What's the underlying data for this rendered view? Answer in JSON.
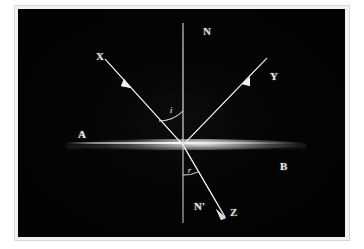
{
  "diagram": {
    "background_color": "#040404",
    "stroke_color": "#e8e8e8",
    "frame_color": "#f2f2f2",
    "labels": {
      "normal_above": "N",
      "normal_below": "N'",
      "incident_ray": "X",
      "reflected_ray": "Y",
      "refracted_ray": "Z",
      "medium_left": "A",
      "medium_right": "B",
      "angle_incidence": "i",
      "angle_refraction": "r"
    },
    "geometry": {
      "origin": {
        "x": 165,
        "y": 136
      },
      "normal_top": {
        "x": 165,
        "y": 14
      },
      "normal_bottom": {
        "x": 165,
        "y": 214
      },
      "incident_start": {
        "x": 87,
        "y": 50
      },
      "incident_arrow": {
        "x": 107,
        "y": 73
      },
      "reflected_end": {
        "x": 247,
        "y": 51
      },
      "reflected_arrow": {
        "x": 228,
        "y": 71
      },
      "refracted_end": {
        "x": 206,
        "y": 207
      },
      "refracted_arrow": {
        "x": 204,
        "y": 205
      },
      "surface_left": {
        "x": 48,
        "y": 136
      },
      "surface_right": {
        "x": 288,
        "y": 136
      }
    }
  }
}
